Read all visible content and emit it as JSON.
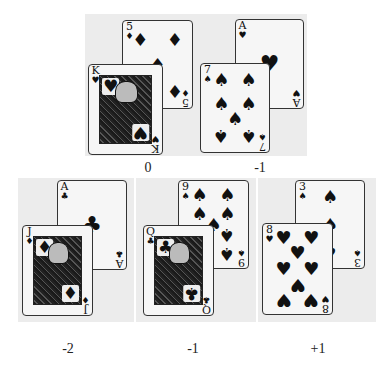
{
  "hands": [
    {
      "label": "0",
      "back_card": {
        "rank": "5",
        "suit": "♦",
        "suit_name": "diamonds"
      },
      "front_card": {
        "rank": "K",
        "suit": "♥",
        "suit_name": "hearts",
        "face": true
      }
    },
    {
      "label": "-1",
      "back_card": {
        "rank": "A",
        "suit": "♥",
        "suit_name": "hearts"
      },
      "front_card": {
        "rank": "7",
        "suit": "♠",
        "suit_name": "spades"
      }
    },
    {
      "label": "-2",
      "back_card": {
        "rank": "A",
        "suit": "♣",
        "suit_name": "clubs"
      },
      "front_card": {
        "rank": "J",
        "suit": "♦",
        "suit_name": "diamonds",
        "face": true
      }
    },
    {
      "label": "-1",
      "back_card": {
        "rank": "9",
        "suit": "♠",
        "suit_name": "spades"
      },
      "front_card": {
        "rank": "Q",
        "suit": "♣",
        "suit_name": "clubs",
        "face": true
      }
    },
    {
      "label": "+1",
      "back_card": {
        "rank": "3",
        "suit": "♠",
        "suit_name": "spades"
      },
      "front_card": {
        "rank": "8",
        "suit": "♥",
        "suit_name": "hearts"
      }
    }
  ],
  "colors": {
    "panel": "#ececec",
    "card": "#f6f6f6",
    "ink": "#111111"
  }
}
